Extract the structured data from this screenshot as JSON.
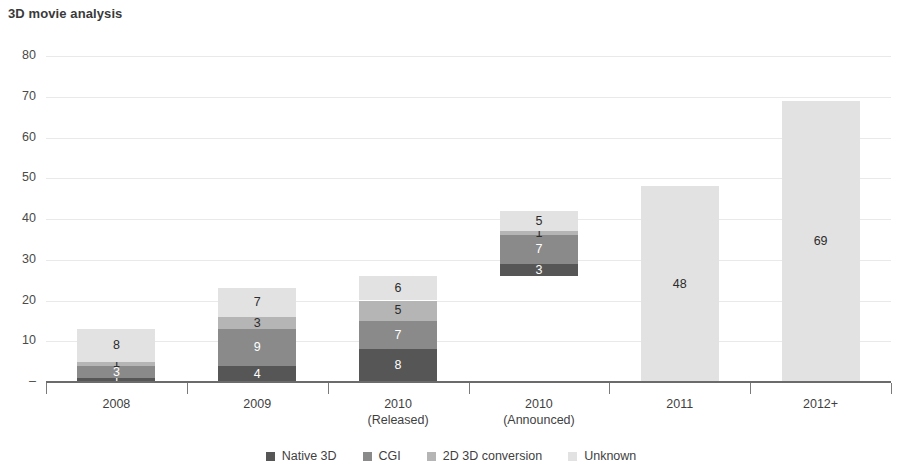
{
  "header": {
    "title": "3D movie analysis"
  },
  "chart_data": {
    "type": "bar",
    "subtype": "stacked-bar",
    "title": "3D movie analysis",
    "xlabel": "",
    "ylabel": "",
    "ylim": [
      0,
      80
    ],
    "ytick_step": 10,
    "grid": true,
    "legend_position": "bottom",
    "zero_tick_label": "–",
    "ytick_labels": [
      "80",
      "70",
      "60",
      "50",
      "40",
      "30",
      "20",
      "10",
      "–"
    ],
    "ytick_values": [
      80,
      70,
      60,
      50,
      40,
      30,
      20,
      10,
      0
    ],
    "categories": [
      "2008",
      "2009",
      "2010",
      "2010",
      "2011",
      "2012+"
    ],
    "category_sublabels": [
      "",
      "",
      "(Released)",
      "(Announced)",
      "",
      ""
    ],
    "series": [
      {
        "name": "Native 3D",
        "color": "#565656",
        "values": [
          1,
          4,
          8,
          3,
          0,
          0
        ]
      },
      {
        "name": "CGI",
        "color": "#8a8a8a",
        "values": [
          3,
          9,
          7,
          7,
          0,
          0
        ]
      },
      {
        "name": "2D 3D conversion",
        "color": "#b5b5b5",
        "values": [
          1,
          3,
          5,
          1,
          0,
          0
        ]
      },
      {
        "name": "Unknown",
        "color": "#e2e2e2",
        "values": [
          8,
          7,
          6,
          5,
          48,
          69
        ]
      }
    ],
    "bar_baselines": [
      0,
      0,
      0,
      26,
      0,
      0
    ],
    "totals": [
      13,
      23,
      26,
      42,
      48,
      69
    ]
  },
  "legend": {
    "items": [
      {
        "label": "Native 3D",
        "color": "#565656"
      },
      {
        "label": "CGI",
        "color": "#8a8a8a"
      },
      {
        "label": "2D 3D conversion",
        "color": "#b5b5b5"
      },
      {
        "label": "Unknown",
        "color": "#e2e2e2"
      }
    ]
  },
  "colors": {
    "gridline": "#e9e9e9",
    "axis": "#6b6b6b",
    "text": "#3f3f3f",
    "background": "#ffffff"
  }
}
